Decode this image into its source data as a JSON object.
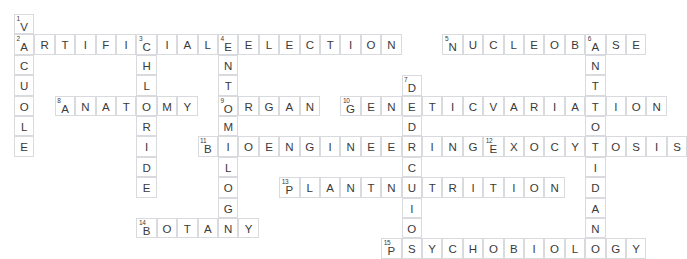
{
  "puzzle": {
    "title": "Biology Crossword Puzzle",
    "grid": {
      "cell_size": 20.4,
      "origin_x": 14,
      "origin_y": 14,
      "columns": 32,
      "rows": 11,
      "cell_border_color": "#d9dade",
      "cell_background": "#ffffff",
      "letter_color": "#3a3a3a",
      "number_color": "#3a3a3a"
    },
    "entries": [
      {
        "number": 1,
        "answer": "VACUOLE",
        "direction": "down",
        "row": 0,
        "col": 0
      },
      {
        "number": 2,
        "answer": "ARTIFICIALSELECTION",
        "direction": "across",
        "row": 1,
        "col": 0
      },
      {
        "number": 3,
        "answer": "CHLORIDE",
        "direction": "down",
        "row": 1,
        "col": 6
      },
      {
        "number": 4,
        "answer": "ENTOMOLOGY",
        "direction": "down",
        "row": 1,
        "col": 10
      },
      {
        "number": 5,
        "answer": "NUCLEOBASE",
        "direction": "across",
        "row": 1,
        "col": 21
      },
      {
        "number": 6,
        "answer": "ANTIOXIDANT",
        "direction": "down",
        "row": 1,
        "col": 28
      },
      {
        "number": 7,
        "answer": "DEDUCTION",
        "direction": "down",
        "row": 3,
        "col": 19
      },
      {
        "number": 8,
        "answer": "ANATOMY",
        "direction": "across",
        "row": 4,
        "col": 2
      },
      {
        "number": 9,
        "answer": "ORGAN",
        "direction": "across",
        "row": 4,
        "col": 10
      },
      {
        "number": 10,
        "answer": "GENETICVARIATION",
        "direction": "across",
        "row": 4,
        "col": 16
      },
      {
        "number": 11,
        "answer": "BIOENGINEERING",
        "direction": "across",
        "row": 6,
        "col": 9
      },
      {
        "number": 12,
        "answer": "EXOCYTOSIS",
        "direction": "across",
        "row": 6,
        "col": 23
      },
      {
        "number": 13,
        "answer": "PLANTNUTRITION",
        "direction": "across",
        "row": 8,
        "col": 13
      },
      {
        "number": 14,
        "answer": "BOTANY",
        "direction": "across",
        "row": 10,
        "col": 6
      },
      {
        "number": 15,
        "answer": "PSYCHOBIOLOGY",
        "direction": "across",
        "row": 11,
        "col": 18
      }
    ]
  }
}
